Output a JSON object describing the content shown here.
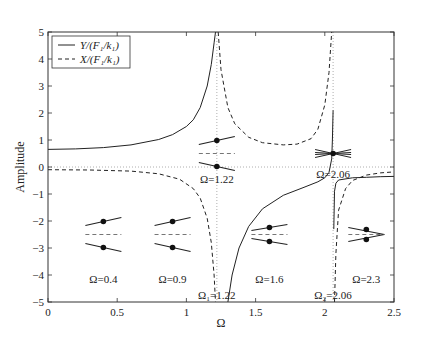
{
  "chart_data": {
    "type": "line",
    "title": "",
    "xlabel": "Ω",
    "ylabel": "Amplitude",
    "xlim": [
      0,
      2.5
    ],
    "ylim": [
      -5,
      5
    ],
    "xticks": [
      "0",
      "0.5",
      "1",
      "1.5",
      "2",
      "2.5"
    ],
    "xtick_values": [
      0,
      0.5,
      1,
      1.5,
      2,
      2.5
    ],
    "yticks": [
      "5",
      "4",
      "3",
      "2",
      "1",
      "0",
      "−1",
      "−2",
      "−3",
      "−4",
      "−5"
    ],
    "ytick_values": [
      5,
      4,
      3,
      2,
      1,
      0,
      -1,
      -2,
      -3,
      -4,
      -5
    ],
    "grid": false,
    "legend_position": "upper left",
    "legend": [
      {
        "label": "Y/(F₁/k₁)",
        "style": "solid"
      },
      {
        "label": "X/(F₁/k₁)",
        "style": "dashed"
      }
    ],
    "series": [
      {
        "name": "Y/(F1/k1)",
        "style": "solid",
        "segments": [
          [
            [
              0,
              0.65
            ],
            [
              0.2,
              0.67
            ],
            [
              0.4,
              0.72
            ],
            [
              0.6,
              0.82
            ],
            [
              0.8,
              1.02
            ],
            [
              0.9,
              1.2
            ],
            [
              1.0,
              1.5
            ],
            [
              1.05,
              1.75
            ],
            [
              1.1,
              2.2
            ],
            [
              1.15,
              3.0
            ],
            [
              1.18,
              3.8
            ],
            [
              1.2,
              4.6
            ],
            [
              1.21,
              5
            ]
          ],
          [
            [
              1.3,
              -5
            ],
            [
              1.33,
              -4
            ],
            [
              1.38,
              -3
            ],
            [
              1.45,
              -2.2
            ],
            [
              1.55,
              -1.55
            ],
            [
              1.7,
              -1.05
            ],
            [
              1.85,
              -0.75
            ],
            [
              1.95,
              -0.55
            ],
            [
              2.0,
              -0.4
            ],
            [
              2.03,
              -0.2
            ],
            [
              2.05,
              0.3
            ],
            [
              2.055,
              1.0
            ],
            [
              2.06,
              2.1
            ]
          ],
          [
            [
              2.065,
              -2.3
            ],
            [
              2.07,
              -0.9
            ],
            [
              2.08,
              -0.6
            ],
            [
              2.1,
              -0.48
            ],
            [
              2.2,
              -0.4
            ],
            [
              2.3,
              -0.38
            ],
            [
              2.4,
              -0.36
            ],
            [
              2.5,
              -0.35
            ]
          ]
        ]
      },
      {
        "name": "X/(F1/k1)",
        "style": "dashed",
        "segments": [
          [
            [
              0,
              -0.1
            ],
            [
              0.3,
              -0.11
            ],
            [
              0.6,
              -0.15
            ],
            [
              0.8,
              -0.25
            ],
            [
              0.95,
              -0.45
            ],
            [
              1.05,
              -0.8
            ],
            [
              1.1,
              -1.15
            ],
            [
              1.15,
              -1.9
            ],
            [
              1.18,
              -2.8
            ],
            [
              1.2,
              -4
            ],
            [
              1.21,
              -5
            ]
          ],
          [
            [
              1.23,
              5
            ],
            [
              1.25,
              3.6
            ],
            [
              1.3,
              2.2
            ],
            [
              1.35,
              1.6
            ],
            [
              1.45,
              1.1
            ],
            [
              1.55,
              0.9
            ],
            [
              1.7,
              0.82
            ],
            [
              1.8,
              0.85
            ],
            [
              1.9,
              1.05
            ],
            [
              1.95,
              1.4
            ],
            [
              2.0,
              2.3
            ],
            [
              2.03,
              3.5
            ],
            [
              2.05,
              5
            ]
          ],
          [
            [
              2.07,
              -5
            ],
            [
              2.08,
              -3.2
            ],
            [
              2.1,
              -1.6
            ],
            [
              2.15,
              -0.8
            ],
            [
              2.2,
              -0.5
            ],
            [
              2.3,
              -0.3
            ],
            [
              2.4,
              -0.22
            ],
            [
              2.5,
              -0.18
            ]
          ]
        ]
      }
    ],
    "reference_lines": [
      {
        "orientation": "horizontal",
        "value": 0,
        "style": "dotted"
      },
      {
        "orientation": "vertical",
        "value": 1.22,
        "style": "dotted"
      },
      {
        "orientation": "vertical",
        "value": 2.06,
        "style": "dotted"
      }
    ],
    "annotations": [
      {
        "text": "Ω=0.4",
        "x": 0.4,
        "y": -4.15
      },
      {
        "text": "Ω=0.9",
        "x": 0.9,
        "y": -4.15
      },
      {
        "text": "Ω=1.22",
        "x": 1.22,
        "y": -0.45
      },
      {
        "text": "Ω=1.6",
        "x": 1.6,
        "y": -4.15
      },
      {
        "text": "Ω=2.06",
        "x": 2.06,
        "y": -0.25
      },
      {
        "text": "Ω=2.3",
        "x": 2.3,
        "y": -4.15
      },
      {
        "text": "Ω₁=1.22",
        "x": 1.22,
        "y": -4.75
      },
      {
        "text": "Ω₂=2.06",
        "x": 2.06,
        "y": -4.75
      }
    ],
    "mode_shapes": [
      {
        "omega": 0.4,
        "x": 0.4,
        "center_y": -2.5,
        "upper_slope": "up",
        "lower_slope": "down"
      },
      {
        "omega": 0.9,
        "x": 0.9,
        "center_y": -2.5,
        "upper_slope": "up",
        "lower_slope": "down"
      },
      {
        "omega": 1.22,
        "x": 1.22,
        "center_y": 0.5,
        "upper_slope": "up",
        "lower_slope": "down"
      },
      {
        "omega": 1.6,
        "x": 1.6,
        "center_y": -2.5,
        "upper_slope": "up-steep",
        "lower_slope": "down-steep"
      },
      {
        "omega": 2.06,
        "x": 2.06,
        "center_y": 0.5,
        "upper_slope": "cross",
        "lower_slope": "cross"
      },
      {
        "omega": 2.3,
        "x": 2.3,
        "center_y": -2.5,
        "upper_slope": "down",
        "lower_slope": "up"
      }
    ]
  }
}
